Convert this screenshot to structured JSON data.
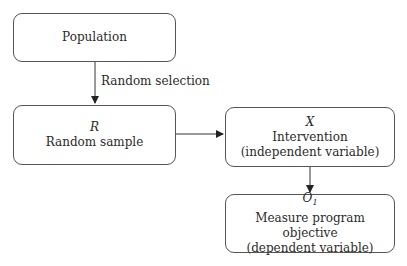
{
  "nodes": {
    "population": {
      "label": "Population"
    },
    "sample": {
      "symbol": "R",
      "label": "Random sample"
    },
    "intervention": {
      "symbol": "X",
      "label": "Intervention",
      "sublabel": "(independent variable)"
    },
    "outcome": {
      "symbol": "O",
      "symbol_sub": "1",
      "label": "Measure program objective",
      "sublabel": "(dependent variable)"
    }
  },
  "edges": {
    "population_to_sample": {
      "label": "Random selection"
    },
    "sample_to_intervention": {
      "label": ""
    },
    "intervention_to_outcome": {
      "label": ""
    }
  }
}
